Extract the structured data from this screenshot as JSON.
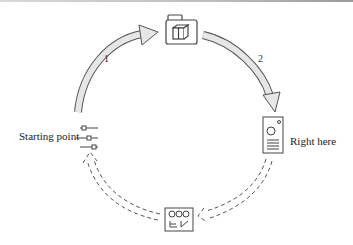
{
  "nodes": {
    "start": {
      "label": "Starting point",
      "icon": "sliders-icon"
    },
    "top": {
      "icon": "folder-box-icon"
    },
    "right": {
      "label": "Right here",
      "icon": "device-speaker-icon"
    },
    "bottom": {
      "icon": "control-panel-icon"
    }
  },
  "edges": [
    {
      "from": "start",
      "to": "top",
      "label": "1",
      "style": "solid-gray"
    },
    {
      "from": "top",
      "to": "right",
      "label": "2",
      "style": "solid-gray"
    },
    {
      "from": "right",
      "to": "bottom",
      "label": "",
      "style": "dashed"
    },
    {
      "from": "bottom",
      "to": "start",
      "label": "",
      "style": "dashed"
    }
  ],
  "colors": {
    "arrow_fill": "#e6e6e6",
    "stroke": "#555555",
    "text": "#222222"
  }
}
